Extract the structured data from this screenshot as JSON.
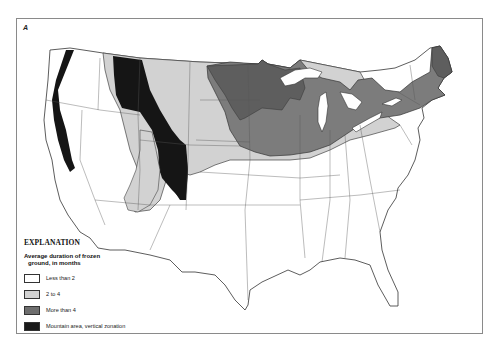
{
  "panel_label": "A",
  "map": {
    "subject": "Average duration of frozen ground across the conterminous United States",
    "region": "Conterminous United States",
    "zones": [
      {
        "id": "less-than-2",
        "color": "#ffffff",
        "regions": [
          "South",
          "Southeast",
          "Pacific coast",
          "Southwest",
          "Great Basin lowlands",
          "Mid-Atlantic"
        ]
      },
      {
        "id": "2-to-4",
        "color": "#d2d2d2",
        "regions": [
          "Northern Great Plains",
          "Central Plains",
          "Eastern Snake River Plain",
          "Colorado Plateau area"
        ]
      },
      {
        "id": "more-than-4",
        "color": "#7c7c7c",
        "regions": [
          "Minnesota",
          "North Dakota east",
          "Wisconsin",
          "Michigan",
          "Upper Midwest belt",
          "New York",
          "New England",
          "Maine"
        ]
      },
      {
        "id": "mountain",
        "color": "#1a1a1a",
        "regions": [
          "Cascades",
          "Sierra Nevada",
          "Northern Rockies",
          "Southern Rockies"
        ]
      }
    ]
  },
  "legend": {
    "title": "EXPLANATION",
    "subtitle_line1": "Average duration of frozen",
    "subtitle_line2": "ground, in months",
    "items": [
      {
        "label": "Less than 2",
        "color": "#ffffff"
      },
      {
        "label": "2 to 4",
        "color": "#d2d2d2"
      },
      {
        "label": "More than 4",
        "color": "#7c7c7c"
      },
      {
        "label": "Mountain area, vertical zonation",
        "color": "#1a1a1a"
      }
    ]
  }
}
